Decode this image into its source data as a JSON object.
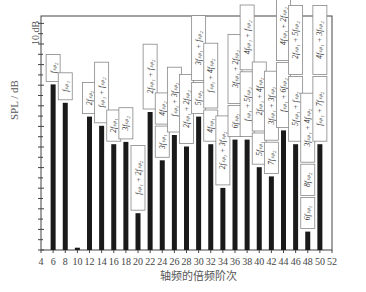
{
  "chart_data": {
    "type": "bar",
    "title": "",
    "xlabel": "轴频的倍频阶次",
    "ylabel": "SPL / dB",
    "scale_annotation": "10 dB",
    "x_ticks": [
      4,
      6,
      8,
      10,
      12,
      14,
      16,
      18,
      20,
      22,
      24,
      26,
      28,
      30,
      32,
      34,
      36,
      38,
      40,
      42,
      44,
      46,
      48,
      50,
      52
    ],
    "xlim": [
      4,
      52
    ],
    "grid": false,
    "legend": null,
    "bar_color": "#1a1a1a",
    "y_unit_note": "relative SPL, bar heights as pixel-estimated relative values (0 = axis floor), ~each major tick = 10 dB span in figure",
    "bars": [
      {
        "x": 6,
        "value": 72,
        "label": "f_sp2"
      },
      {
        "x": 8,
        "value": 64,
        "label": "f_sp1"
      },
      {
        "x": 10,
        "value": 1,
        "label": ""
      },
      {
        "x": 12,
        "value": 58,
        "label": "2f_sp2"
      },
      {
        "x": 14,
        "value": 54,
        "label": "f_sp1 + f_sp2"
      },
      {
        "x": 16,
        "value": 46,
        "label": "2f_sp1"
      },
      {
        "x": 18,
        "value": 47,
        "label": "3f_sp2"
      },
      {
        "x": 20,
        "value": 16,
        "label": "f_sp1 + 2f_sp2"
      },
      {
        "x": 22,
        "value": 60,
        "label": "2f_sp1 + f_sp2"
      },
      {
        "x": 24,
        "value": 39,
        "label": "3f_sp1 / 4f_sp2"
      },
      {
        "x": 26,
        "value": 50,
        "label": "f_sp1 + 3f_sp2"
      },
      {
        "x": 28,
        "value": 45,
        "label": "2f_sp1 + 2f_sp2"
      },
      {
        "x": 30,
        "value": 58,
        "label": "5f_sp2 / 3f_sp1 + f_sp2"
      },
      {
        "x": 32,
        "value": 46,
        "label": "4f_sp1 / f_sp1 + 4f_sp2"
      },
      {
        "x": 34,
        "value": 27,
        "label": "2f_sp1 + 3f_sp2"
      },
      {
        "x": 36,
        "value": 48,
        "label": "6f_sp2 / 3f_sp1 + 2f_sp2"
      },
      {
        "x": 38,
        "value": 48,
        "label": "f_sp1 + 5f_sp2 / 4f_sp1 + f_sp2"
      },
      {
        "x": 40,
        "value": 36,
        "label": "5f_sp1 / 2f_sp1 + 4f_sp2"
      },
      {
        "x": 42,
        "value": 32,
        "label": "7f_sp2 / 3f_sp1 + 3f_sp2"
      },
      {
        "x": 44,
        "value": 52,
        "label": "f_sp1 + 6f_sp2 / 4f_sp1 + 2f_sp2"
      },
      {
        "x": 46,
        "value": 46,
        "label": "5f_sp1 + f_sp2 / 2f_sp1 + 5f_sp2"
      },
      {
        "x": 48,
        "value": 8,
        "label": "6f_sp1 / 8f_sp2 / 3f_sp1 + 4f_sp2"
      },
      {
        "x": 50,
        "value": 46,
        "label": "f_sp1 + 7f_sp2 / 4f_sp1 + 3f_sp2"
      }
    ],
    "annotations": [
      {
        "x": 6,
        "boxes": [
          "f_sp2"
        ]
      },
      {
        "x": 8,
        "boxes": [
          "f_sp1"
        ]
      },
      {
        "x": 12,
        "boxes": [
          "2f_sp2"
        ]
      },
      {
        "x": 14,
        "boxes": [
          "f_sp1 + f_sp2"
        ]
      },
      {
        "x": 16,
        "boxes": [
          "2f_sp1"
        ]
      },
      {
        "x": 18,
        "boxes": [
          "3f_sp2"
        ]
      },
      {
        "x": 20,
        "boxes": [
          "f_sp1 + 2f_sp2"
        ]
      },
      {
        "x": 22,
        "boxes": [
          "2f_sp1 + f_sp2"
        ]
      },
      {
        "x": 24,
        "boxes": [
          "3f_sp1",
          "4f_sp2"
        ]
      },
      {
        "x": 26,
        "boxes": [
          "f_sp1 + 3f_sp2"
        ]
      },
      {
        "x": 28,
        "boxes": [
          "2f_sp1 + 2f_sp2"
        ]
      },
      {
        "x": 30,
        "boxes": [
          "5f_sp2",
          "3f_sp1 + f_sp2"
        ]
      },
      {
        "x": 32,
        "boxes": [
          "4f_sp1",
          "f_sp1 + 4f_sp2"
        ]
      },
      {
        "x": 34,
        "boxes": [
          "2f_sp1 + 3f_sp2"
        ]
      },
      {
        "x": 36,
        "boxes": [
          "6f_sp2",
          "3f_sp1 + 2f_sp2"
        ]
      },
      {
        "x": 38,
        "boxes": [
          "f_sp1 + 5f_sp2",
          "4f_sp1 + f_sp2"
        ]
      },
      {
        "x": 40,
        "boxes": [
          "5f_sp1",
          "2f_sp1 + 4f_sp2"
        ]
      },
      {
        "x": 42,
        "boxes": [
          "7f_sp2",
          "3f_sp1 + 3f_sp2"
        ]
      },
      {
        "x": 44,
        "boxes": [
          "f_sp1 + 6f_sp2",
          "4f_sp1 + 2f_sp2"
        ]
      },
      {
        "x": 46,
        "boxes": [
          "5f_sp1 + f_sp2",
          "2f_sp1 + 5f_sp2"
        ]
      },
      {
        "x": 48,
        "boxes": [
          "6f_sp1",
          "8f_sp2",
          "3f_sp1 + 4f_sp2"
        ]
      },
      {
        "x": 50,
        "boxes": [
          "f_sp1 + 7f_sp2",
          "4f_sp1 + 3f_sp2"
        ]
      }
    ]
  },
  "labels": {
    "xlabel": "轴频的倍频阶次",
    "ylabel": "SPL / dB",
    "scale": "10 dB"
  }
}
